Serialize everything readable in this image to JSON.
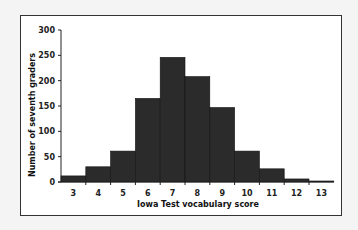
{
  "chart_data": {
    "type": "bar",
    "title": "",
    "xlabel": "Iowa Test vocabulary score",
    "ylabel": "Number of seventh graders",
    "categories": [
      "3",
      "4",
      "5",
      "6",
      "7",
      "8",
      "9",
      "10",
      "11",
      "12",
      "13"
    ],
    "values": [
      12,
      30,
      61,
      165,
      246,
      208,
      147,
      61,
      26,
      6,
      2
    ],
    "ylim": [
      0,
      300
    ],
    "yticks": [
      0,
      50,
      100,
      150,
      200,
      250,
      300
    ],
    "grid": false,
    "legend": "none",
    "bar_color": "#2b2b2b"
  }
}
